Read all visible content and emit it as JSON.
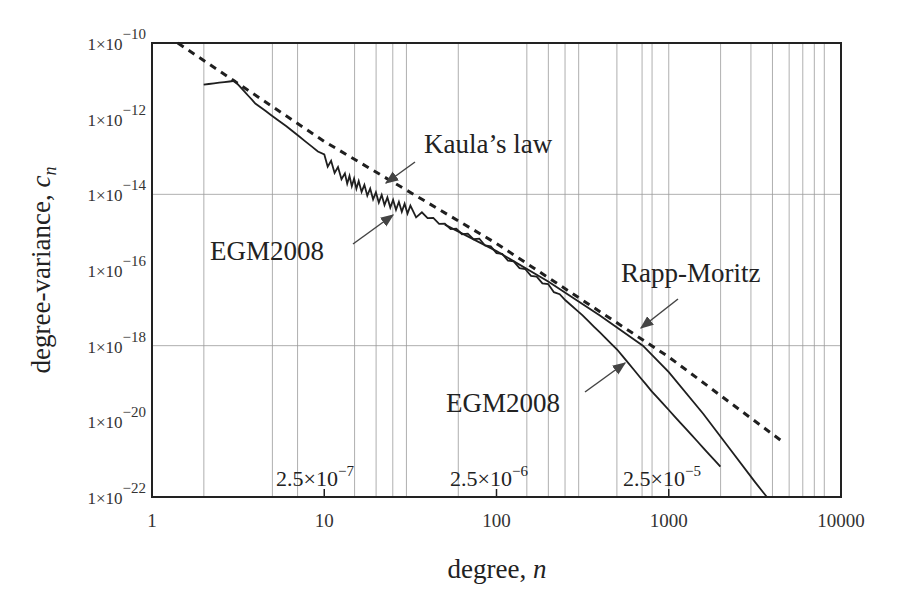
{
  "chart_data": {
    "type": "line",
    "title": "",
    "xlabel": "degree, n",
    "ylabel": "degree-variance, c_n",
    "xscale": "log",
    "yscale": "log",
    "xlim": [
      1,
      10000
    ],
    "ylim": [
      1e-22,
      1e-10
    ],
    "x_ticks": [
      {
        "value": 1,
        "label": "1"
      },
      {
        "value": 10,
        "label": "10"
      },
      {
        "value": 100,
        "label": "100"
      },
      {
        "value": 1000,
        "label": "1000"
      },
      {
        "value": 10000,
        "label": "10000"
      }
    ],
    "y_ticks": [
      {
        "value": -10,
        "base": "1×10",
        "exp": "−10"
      },
      {
        "value": -12,
        "base": "1×10",
        "exp": "−12"
      },
      {
        "value": -14,
        "base": "1×10",
        "exp": "−14"
      },
      {
        "value": -16,
        "base": "1×10",
        "exp": "−16"
      },
      {
        "value": -18,
        "base": "1×10",
        "exp": "−18"
      },
      {
        "value": -20,
        "base": "1×10",
        "exp": "−20"
      },
      {
        "value": -22,
        "base": "1×10",
        "exp": "−22"
      }
    ],
    "horizontal_gridlines_log10": [
      -14,
      -18
    ],
    "vertical_gridlines_n": [
      2,
      5,
      7,
      15,
      20,
      25,
      30,
      60,
      150,
      200,
      250,
      300,
      500,
      700,
      800,
      1000,
      2000,
      3000,
      4000,
      5000,
      6000,
      7000,
      8000
    ],
    "series": [
      {
        "name": "Kaula's law",
        "style": "dashed",
        "points_log10": [
          [
            0.15,
            -10.0
          ],
          [
            1.0,
            -12.6
          ],
          [
            2.0,
            -15.3
          ],
          [
            3.0,
            -18.3
          ],
          [
            3.65,
            -20.5
          ]
        ]
      },
      {
        "name": "EGM2008",
        "style": "solid",
        "points_log10": [
          [
            0.3,
            -11.1
          ],
          [
            0.48,
            -11.0
          ],
          [
            0.6,
            -11.6
          ],
          [
            0.78,
            -12.2
          ],
          [
            1.0,
            -13.0
          ],
          [
            1.12,
            -13.5
          ],
          [
            1.2,
            -13.7
          ],
          [
            1.3,
            -14.0
          ],
          [
            1.4,
            -14.2
          ],
          [
            1.5,
            -14.35
          ],
          [
            1.7,
            -14.8
          ],
          [
            1.9,
            -15.2
          ],
          [
            2.1,
            -15.8
          ],
          [
            2.3,
            -16.4
          ],
          [
            2.5,
            -17.2
          ],
          [
            2.7,
            -18.1
          ],
          [
            2.9,
            -19.2
          ],
          [
            3.1,
            -20.2
          ],
          [
            3.3,
            -21.2
          ]
        ]
      },
      {
        "name": "Rapp-Moritz",
        "style": "solid",
        "points_log10": [
          [
            1.7,
            -14.8
          ],
          [
            2.0,
            -15.5
          ],
          [
            2.3,
            -16.3
          ],
          [
            2.6,
            -17.2
          ],
          [
            2.85,
            -18.0
          ],
          [
            3.0,
            -18.7
          ],
          [
            3.2,
            -19.8
          ],
          [
            3.35,
            -20.7
          ],
          [
            3.5,
            -21.6
          ],
          [
            3.57,
            -22.0
          ]
        ]
      }
    ],
    "annotations": [
      {
        "text": "Kaula's law",
        "target_series": "Kaula's law"
      },
      {
        "text": "EGM2008",
        "target_series": "EGM2008",
        "position": "upper"
      },
      {
        "text": "EGM2008",
        "target_series": "EGM2008",
        "position": "lower"
      },
      {
        "text": "Rapp-Moritz",
        "target_series": "Rapp-Moritz"
      }
    ],
    "inline_labels": [
      {
        "base": "2.5×10",
        "exp": "−7",
        "near_n": 10
      },
      {
        "base": "2.5×10",
        "exp": "−6",
        "near_n": 100
      },
      {
        "base": "2.5×10",
        "exp": "−5",
        "near_n": 1000
      }
    ]
  },
  "axes": {
    "xlabel_main": "degree, ",
    "xlabel_var": "n",
    "ylabel_main": "degree-variance, ",
    "ylabel_var": "c",
    "ylabel_sub": "n"
  },
  "labels": {
    "kaula": "Kaula’s law",
    "egm_upper": "EGM2008",
    "egm_lower": "EGM2008",
    "rapp": "Rapp-Moritz",
    "res1_base": "2.5×10",
    "res1_exp": "−7",
    "res2_base": "2.5×10",
    "res2_exp": "−6",
    "res3_base": "2.5×10",
    "res3_exp": "−5"
  },
  "colors": {
    "axis": "#222222",
    "grid": "#9a9a9a",
    "curve": "#1f1f1f",
    "text": "#222222"
  }
}
